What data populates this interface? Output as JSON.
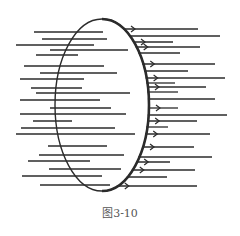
{
  "figure": {
    "caption": "图3-10",
    "stroke_color": "#2b2b2b",
    "ellipse": {
      "cx": 102,
      "cy": 105,
      "rx": 47,
      "ry": 86
    },
    "left_lines": [
      {
        "y": 32,
        "x1": 34,
        "x2": 103
      },
      {
        "y": 39,
        "x1": 42,
        "x2": 107
      },
      {
        "y": 45,
        "x1": 16,
        "x2": 94
      },
      {
        "y": 50,
        "x1": 50,
        "x2": 128
      },
      {
        "y": 55,
        "x1": 36,
        "x2": 78
      },
      {
        "y": 66,
        "x1": 24,
        "x2": 104
      },
      {
        "y": 73,
        "x1": 40,
        "x2": 117
      },
      {
        "y": 79,
        "x1": 20,
        "x2": 84
      },
      {
        "y": 88,
        "x1": 31,
        "x2": 82
      },
      {
        "y": 93,
        "x1": 36,
        "x2": 130
      },
      {
        "y": 100,
        "x1": 20,
        "x2": 100
      },
      {
        "y": 108,
        "x1": 50,
        "x2": 111
      },
      {
        "y": 114,
        "x1": 20,
        "x2": 126
      },
      {
        "y": 121,
        "x1": 33,
        "x2": 72
      },
      {
        "y": 128,
        "x1": 21,
        "x2": 115
      },
      {
        "y": 134,
        "x1": 16,
        "x2": 135
      },
      {
        "y": 146,
        "x1": 48,
        "x2": 107
      },
      {
        "y": 155,
        "x1": 39,
        "x2": 124
      },
      {
        "y": 161,
        "x1": 28,
        "x2": 90
      },
      {
        "y": 169,
        "x1": 49,
        "x2": 121
      },
      {
        "y": 176,
        "x1": 22,
        "x2": 102
      },
      {
        "y": 185,
        "x1": 40,
        "x2": 110
      }
    ],
    "right_lines": [
      {
        "y": 29,
        "x2": 198,
        "arrow": true
      },
      {
        "y": 36,
        "x2": 220,
        "arrow": false
      },
      {
        "y": 42,
        "x2": 173,
        "arrow": true
      },
      {
        "y": 47,
        "x2": 200,
        "arrow": true
      },
      {
        "y": 53,
        "x2": 180,
        "arrow": false
      },
      {
        "y": 64,
        "x2": 215,
        "arrow": true
      },
      {
        "y": 71,
        "x2": 188,
        "arrow": false
      },
      {
        "y": 78,
        "x2": 225,
        "arrow": true
      },
      {
        "y": 83,
        "x2": 175,
        "arrow": false
      },
      {
        "y": 87,
        "x2": 206,
        "arrow": true
      },
      {
        "y": 92,
        "x2": 178,
        "arrow": false
      },
      {
        "y": 99,
        "x2": 215,
        "arrow": false
      },
      {
        "y": 108,
        "x2": 178,
        "arrow": true
      },
      {
        "y": 115,
        "x2": 227,
        "arrow": false
      },
      {
        "y": 121,
        "x2": 197,
        "arrow": true
      },
      {
        "y": 127,
        "x2": 168,
        "arrow": false
      },
      {
        "y": 134,
        "x2": 210,
        "arrow": true
      },
      {
        "y": 147,
        "x2": 194,
        "arrow": true
      },
      {
        "y": 157,
        "x2": 212,
        "arrow": false
      },
      {
        "y": 162,
        "x2": 170,
        "arrow": true
      },
      {
        "y": 170,
        "x2": 195,
        "arrow": true
      },
      {
        "y": 177,
        "x2": 167,
        "arrow": false
      },
      {
        "y": 186,
        "x2": 197,
        "arrow": true
      }
    ]
  }
}
